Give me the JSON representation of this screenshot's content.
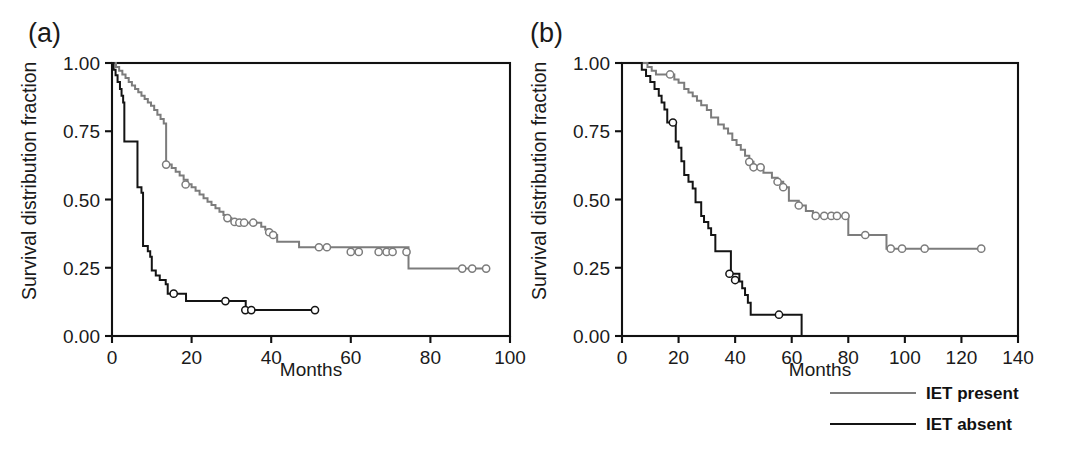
{
  "figure": {
    "background": "#ffffff",
    "width": 1067,
    "height": 458
  },
  "panels": {
    "a": {
      "label": "(a)",
      "xlabel": "Months",
      "ylabel": "Survival distribution fraction"
    },
    "b": {
      "label": "(b)",
      "xlabel": "Months",
      "ylabel": "Survival distribution fraction"
    }
  },
  "legend": {
    "position": "bottom-right",
    "items": [
      {
        "label": "IET present",
        "color": "#7c7c7c"
      },
      {
        "label": "IET absent",
        "color": "#141414"
      }
    ]
  },
  "colors": {
    "iet_present": "#7c7c7c",
    "iet_absent": "#141414",
    "axis": "#111111",
    "text": "#1a1a1a"
  },
  "chart_data": [
    {
      "id": "panel-a",
      "type": "line",
      "subtype": "kaplan-meier-step",
      "title": "(a)",
      "xlabel": "Months",
      "ylabel": "Survival distribution fraction",
      "xlim": [
        0,
        100
      ],
      "ylim": [
        0.0,
        1.0
      ],
      "xticks": [
        0,
        20,
        40,
        60,
        80,
        100
      ],
      "yticks": [
        0.0,
        0.25,
        0.5,
        0.75,
        1.0
      ],
      "ytick_labels": [
        "0.00",
        "0.25",
        "0.50",
        "0.75",
        "1.00"
      ],
      "xtick_labels": [
        "0",
        "20",
        "40",
        "60",
        "80",
        "100"
      ],
      "grid": false,
      "legend_position": "external-bottom-right",
      "series": [
        {
          "name": "IET present",
          "color": "#7c7c7c",
          "steps": [
            [
              0.0,
              1.0
            ],
            [
              1.0,
              0.985
            ],
            [
              1.8,
              0.972
            ],
            [
              2.6,
              0.958
            ],
            [
              3.4,
              0.945
            ],
            [
              4.2,
              0.93
            ],
            [
              5.0,
              0.918
            ],
            [
              5.8,
              0.905
            ],
            [
              6.6,
              0.893
            ],
            [
              7.4,
              0.88
            ],
            [
              8.2,
              0.868
            ],
            [
              9.0,
              0.855
            ],
            [
              9.8,
              0.843
            ],
            [
              10.6,
              0.828
            ],
            [
              11.4,
              0.81
            ],
            [
              12.2,
              0.795
            ],
            [
              13.0,
              0.778
            ],
            [
              13.6,
              0.628
            ],
            [
              15.0,
              0.615
            ],
            [
              16.0,
              0.602
            ],
            [
              17.0,
              0.588
            ],
            [
              18.0,
              0.572
            ],
            [
              19.0,
              0.556
            ],
            [
              20.0,
              0.545
            ],
            [
              21.0,
              0.532
            ],
            [
              22.0,
              0.518
            ],
            [
              23.0,
              0.505
            ],
            [
              24.0,
              0.492
            ],
            [
              25.0,
              0.48
            ],
            [
              26.0,
              0.468
            ],
            [
              27.0,
              0.455
            ],
            [
              28.0,
              0.443
            ],
            [
              29.0,
              0.432
            ],
            [
              30.0,
              0.42
            ],
            [
              31.0,
              0.415
            ],
            [
              36.5,
              0.415
            ],
            [
              37.5,
              0.4
            ],
            [
              38.5,
              0.39
            ],
            [
              39.5,
              0.38
            ],
            [
              40.5,
              0.37
            ],
            [
              41.5,
              0.345
            ],
            [
              46.0,
              0.345
            ],
            [
              47.0,
              0.325
            ],
            [
              74.0,
              0.325
            ],
            [
              74.5,
              0.247
            ],
            [
              94.0,
              0.247
            ]
          ],
          "censored": [
            [
              13.6,
              0.628
            ],
            [
              18.5,
              0.555
            ],
            [
              29.0,
              0.432
            ],
            [
              30.8,
              0.418
            ],
            [
              32.0,
              0.415
            ],
            [
              33.2,
              0.415
            ],
            [
              35.5,
              0.415
            ],
            [
              39.5,
              0.38
            ],
            [
              40.5,
              0.37
            ],
            [
              52.0,
              0.325
            ],
            [
              54.0,
              0.325
            ],
            [
              60.0,
              0.308
            ],
            [
              62.0,
              0.308
            ],
            [
              67.0,
              0.308
            ],
            [
              69.0,
              0.308
            ],
            [
              70.5,
              0.308
            ],
            [
              74.0,
              0.308
            ],
            [
              88.0,
              0.247
            ],
            [
              90.5,
              0.247
            ],
            [
              94.0,
              0.247
            ]
          ]
        },
        {
          "name": "IET absent",
          "color": "#141414",
          "steps": [
            [
              0.0,
              1.0
            ],
            [
              0.4,
              0.975
            ],
            [
              0.9,
              0.955
            ],
            [
              1.4,
              0.93
            ],
            [
              2.0,
              0.905
            ],
            [
              2.4,
              0.88
            ],
            [
              2.8,
              0.855
            ],
            [
              3.1,
              0.712
            ],
            [
              6.0,
              0.712
            ],
            [
              6.4,
              0.545
            ],
            [
              7.4,
              0.525
            ],
            [
              7.8,
              0.33
            ],
            [
              9.0,
              0.31
            ],
            [
              9.6,
              0.29
            ],
            [
              10.0,
              0.24
            ],
            [
              11.0,
              0.222
            ],
            [
              12.0,
              0.205
            ],
            [
              13.5,
              0.19
            ],
            [
              14.0,
              0.155
            ],
            [
              18.0,
              0.155
            ],
            [
              18.6,
              0.128
            ],
            [
              33.0,
              0.128
            ],
            [
              33.6,
              0.095
            ],
            [
              51.0,
              0.095
            ]
          ],
          "censored": [
            [
              15.5,
              0.155
            ],
            [
              28.5,
              0.128
            ],
            [
              33.5,
              0.095
            ],
            [
              35.0,
              0.095
            ],
            [
              51.0,
              0.095
            ]
          ]
        }
      ]
    },
    {
      "id": "panel-b",
      "type": "line",
      "subtype": "kaplan-meier-step",
      "title": "(b)",
      "xlabel": "Months",
      "ylabel": "Survival distribution fraction",
      "xlim": [
        0,
        140
      ],
      "ylim": [
        0.0,
        1.0
      ],
      "xticks": [
        0,
        20,
        40,
        60,
        80,
        100,
        120,
        140
      ],
      "yticks": [
        0.0,
        0.25,
        0.5,
        0.75,
        1.0
      ],
      "ytick_labels": [
        "0.00",
        "0.25",
        "0.50",
        "0.75",
        "1.00"
      ],
      "xtick_labels": [
        "0",
        "20",
        "40",
        "60",
        "80",
        "100",
        "120",
        "140"
      ],
      "grid": false,
      "legend_position": "external-bottom-right",
      "series": [
        {
          "name": "IET present",
          "color": "#7c7c7c",
          "steps": [
            [
              0.0,
              1.0
            ],
            [
              8.0,
              1.0
            ],
            [
              9.0,
              0.985
            ],
            [
              10.5,
              0.972
            ],
            [
              12.0,
              0.958
            ],
            [
              17.0,
              0.958
            ],
            [
              18.5,
              0.94
            ],
            [
              20.0,
              0.928
            ],
            [
              22.0,
              0.905
            ],
            [
              23.5,
              0.892
            ],
            [
              25.0,
              0.878
            ],
            [
              26.5,
              0.862
            ],
            [
              28.0,
              0.845
            ],
            [
              30.0,
              0.828
            ],
            [
              31.5,
              0.8
            ],
            [
              34.0,
              0.775
            ],
            [
              36.0,
              0.76
            ],
            [
              37.5,
              0.742
            ],
            [
              39.0,
              0.718
            ],
            [
              40.5,
              0.7
            ],
            [
              42.0,
              0.682
            ],
            [
              43.5,
              0.66
            ],
            [
              45.0,
              0.638
            ],
            [
              46.5,
              0.618
            ],
            [
              49.0,
              0.618
            ],
            [
              50.0,
              0.598
            ],
            [
              53.0,
              0.58
            ],
            [
              55.0,
              0.565
            ],
            [
              57.0,
              0.545
            ],
            [
              59.0,
              0.495
            ],
            [
              62.5,
              0.478
            ],
            [
              65.0,
              0.458
            ],
            [
              67.5,
              0.44
            ],
            [
              79.0,
              0.44
            ],
            [
              80.0,
              0.37
            ],
            [
              92.5,
              0.37
            ],
            [
              93.5,
              0.32
            ],
            [
              127.0,
              0.32
            ]
          ],
          "censored": [
            [
              17.0,
              0.958
            ],
            [
              45.0,
              0.638
            ],
            [
              46.5,
              0.618
            ],
            [
              49.0,
              0.618
            ],
            [
              55.0,
              0.565
            ],
            [
              57.0,
              0.545
            ],
            [
              62.5,
              0.478
            ],
            [
              68.5,
              0.44
            ],
            [
              71.5,
              0.44
            ],
            [
              74.0,
              0.44
            ],
            [
              76.0,
              0.44
            ],
            [
              79.0,
              0.44
            ],
            [
              86.0,
              0.37
            ],
            [
              95.0,
              0.32
            ],
            [
              99.0,
              0.32
            ],
            [
              107.0,
              0.32
            ],
            [
              127.0,
              0.32
            ]
          ]
        },
        {
          "name": "IET absent",
          "color": "#141414",
          "steps": [
            [
              0.0,
              1.0
            ],
            [
              6.0,
              1.0
            ],
            [
              7.0,
              0.975
            ],
            [
              8.5,
              0.952
            ],
            [
              10.0,
              0.93
            ],
            [
              11.5,
              0.905
            ],
            [
              13.0,
              0.88
            ],
            [
              14.0,
              0.855
            ],
            [
              15.0,
              0.83
            ],
            [
              16.0,
              0.782
            ],
            [
              18.5,
              0.782
            ],
            [
              19.0,
              0.712
            ],
            [
              20.0,
              0.69
            ],
            [
              21.0,
              0.64
            ],
            [
              22.0,
              0.59
            ],
            [
              23.5,
              0.565
            ],
            [
              25.0,
              0.54
            ],
            [
              26.0,
              0.49
            ],
            [
              28.0,
              0.44
            ],
            [
              29.0,
              0.418
            ],
            [
              30.5,
              0.395
            ],
            [
              31.5,
              0.37
            ],
            [
              33.0,
              0.31
            ],
            [
              38.0,
              0.31
            ],
            [
              38.5,
              0.228
            ],
            [
              41.0,
              0.228
            ],
            [
              41.5,
              0.2
            ],
            [
              42.5,
              0.175
            ],
            [
              43.5,
              0.15
            ],
            [
              44.5,
              0.122
            ],
            [
              45.5,
              0.078
            ],
            [
              63.0,
              0.078
            ],
            [
              63.5,
              0.0
            ]
          ],
          "censored": [
            [
              18.0,
              0.782
            ],
            [
              38.0,
              0.228
            ],
            [
              40.0,
              0.205
            ],
            [
              55.5,
              0.078
            ]
          ]
        }
      ]
    }
  ]
}
